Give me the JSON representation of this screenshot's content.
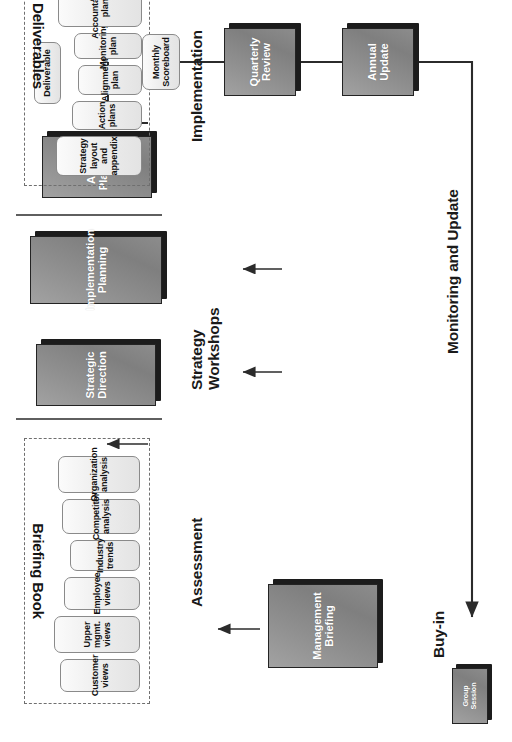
{
  "diagram": {
    "title_visible": false,
    "orientation_note": "rotated",
    "monitoring_label": "Monitoring and Update",
    "colors": {
      "process_fill_dark": "#8f8f8f",
      "process_border": "#232323",
      "process_shadow": "#1c1c1c",
      "process_text": "#ffffff",
      "deliverable_fill": "#ececec",
      "deliverable_border": "#8a8a8a",
      "deliverable_text": "#111111",
      "group_dash": "#6f6f6f",
      "divider": "#5f5f5f",
      "wire": "#2b2b2b",
      "page_background": "#ffffff"
    }
  },
  "legend": {
    "group_session": "Group\nSession",
    "deliverable": "Deliverable"
  },
  "phases": [
    {
      "key": "buyin",
      "label": "Buy-in"
    },
    {
      "key": "assessment",
      "label": "Assessment"
    },
    {
      "key": "workshops",
      "label": "Strategy\nWorkshops"
    },
    {
      "key": "implementation",
      "label": "Implementation"
    }
  ],
  "groups": [
    {
      "key": "briefing_book",
      "title": "Briefing Book"
    },
    {
      "key": "deliverables",
      "title": "Deliverables"
    }
  ],
  "briefing_book_items": [
    "Customer\nviews",
    "Upper mgmt.\nviews",
    "Employee\nviews",
    "Industry\ntrends",
    "Competitor\nanalysis",
    "Organization\nanalysis"
  ],
  "deliverables_items": [
    "Strategy layout\nand appendix",
    "Action plans",
    "Alignment\nplan",
    "Monitoring\nplan",
    "Accountability\nplan",
    "Communications\nplan"
  ],
  "process_boxes": [
    {
      "key": "management_briefing",
      "label": "Management\nBriefing"
    },
    {
      "key": "strategic_direction",
      "label": "Strategic\nDirection"
    },
    {
      "key": "implementation_planning",
      "label": "Implementation\nPlanning"
    },
    {
      "key": "action_planning",
      "label": "Action\nPlanning"
    },
    {
      "key": "annual_update",
      "label": "Annual\nUpdate"
    },
    {
      "key": "quarterly_review",
      "label": "Quarterly\nReview"
    }
  ],
  "monitoring_boxes": [
    {
      "key": "monthly_scoreboard",
      "label": "Monthly\nScoreboard"
    }
  ]
}
